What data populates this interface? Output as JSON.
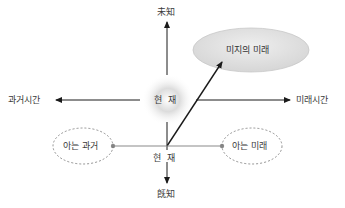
{
  "diagram": {
    "axis_top": "未知",
    "axis_bottom": "旣知",
    "axis_left": "과거시간",
    "axis_right": "미래시간",
    "center_present": "현  재",
    "lower_present": "현  재",
    "unknown_future": "미지의 미래",
    "known_past": "아는 과거",
    "known_future": "아는 미래"
  },
  "colors": {
    "line": "#1a1a1a",
    "gray_line": "#8a8a8a",
    "ellipse_fill": "#e4e4e4",
    "dashed": "#777777",
    "text": "#3a3a3a"
  }
}
